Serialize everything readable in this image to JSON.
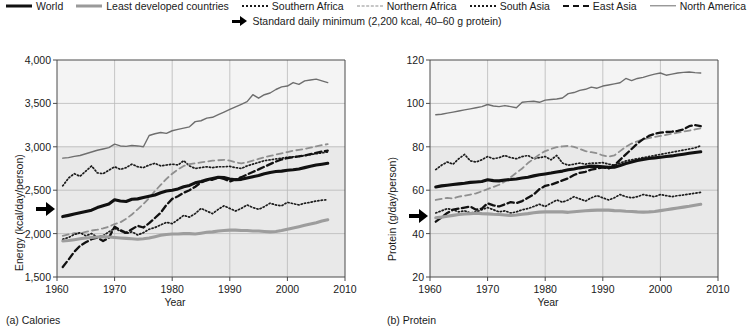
{
  "legend": {
    "items": [
      {
        "label": "World",
        "style": "solid-thick",
        "color": "#111111"
      },
      {
        "label": "Least developed countries",
        "style": "solid-grey",
        "color": "#9d9d9d"
      },
      {
        "label": "Southern Africa",
        "style": "dotted",
        "color": "#1c1c1c"
      },
      {
        "label": "Northern Africa",
        "style": "dashed-grey",
        "color": "#8f8f8f"
      },
      {
        "label": "South Asia",
        "style": "dotted",
        "color": "#1c1c1c"
      },
      {
        "label": "East Asia",
        "style": "dashed-dark",
        "color": "#111111"
      },
      {
        "label": "North America",
        "style": "solid-thin",
        "color": "#6e6e6e"
      }
    ],
    "annotation": {
      "icon": "right-arrow-icon",
      "label": "Standard daily minimum (2,200 kcal, 40–60 g protein)"
    }
  },
  "panels": {
    "left": {
      "caption": "(a) Calories",
      "xlabel": "Year",
      "ylabel": "Energy (kcal/day/person)",
      "ytick_labels": [
        "4,000",
        "3,500",
        "3,000",
        "2,500",
        "2,000",
        "1,500"
      ],
      "xtick_labels": [
        "1960",
        "1970",
        "1980",
        "1990",
        "2000",
        "2010"
      ],
      "reference_arrow_value": "2,200"
    },
    "right": {
      "caption": "(b) Protein",
      "xlabel": "Year",
      "ylabel": "Protein (g/day/person)",
      "ytick_labels": [
        "120",
        "100",
        "80",
        "60",
        "40",
        "20"
      ],
      "xtick_labels": [
        "1960",
        "1970",
        "1980",
        "1990",
        "2000",
        "2010"
      ],
      "reference_arrow_value": "48"
    }
  },
  "chart_data": [
    {
      "type": "line",
      "title": "(a) Calories",
      "xlabel": "Year",
      "ylabel": "Energy (kcal/day/person)",
      "xlim": [
        1960,
        2010
      ],
      "ylim": [
        1500,
        4000
      ],
      "yticks": [
        1500,
        2000,
        2500,
        3000,
        3500,
        4000
      ],
      "xticks": [
        1960,
        1970,
        1980,
        1990,
        2000,
        2010
      ],
      "grid": true,
      "legend_position": "top",
      "annotations": [
        {
          "text": "Standard daily minimum",
          "y": 2200,
          "marker": "arrow-left-axis"
        }
      ],
      "x": [
        1961,
        1962,
        1963,
        1964,
        1965,
        1966,
        1967,
        1968,
        1969,
        1970,
        1971,
        1972,
        1973,
        1974,
        1975,
        1976,
        1977,
        1978,
        1979,
        1980,
        1981,
        1982,
        1983,
        1984,
        1985,
        1986,
        1987,
        1988,
        1989,
        1990,
        1991,
        1992,
        1993,
        1994,
        1995,
        1996,
        1997,
        1998,
        1999,
        2000,
        2001,
        2002,
        2003,
        2004,
        2005,
        2006,
        2007
      ],
      "series": [
        {
          "name": "World",
          "style": "solid-thick",
          "color": "#111111",
          "values": [
            2196,
            2210,
            2225,
            2240,
            2255,
            2270,
            2300,
            2320,
            2340,
            2390,
            2375,
            2370,
            2395,
            2400,
            2415,
            2430,
            2445,
            2470,
            2490,
            2500,
            2515,
            2540,
            2555,
            2585,
            2600,
            2620,
            2635,
            2650,
            2645,
            2630,
            2620,
            2625,
            2640,
            2655,
            2670,
            2690,
            2705,
            2715,
            2720,
            2730,
            2735,
            2745,
            2760,
            2775,
            2790,
            2800,
            2810
          ]
        },
        {
          "name": "Least developed countries",
          "style": "solid-grey",
          "color": "#9d9d9d",
          "values": [
            1915,
            1920,
            1930,
            1940,
            1950,
            1955,
            1960,
            1965,
            1960,
            1955,
            1950,
            1945,
            1940,
            1935,
            1940,
            1950,
            1965,
            1980,
            1990,
            1995,
            1995,
            2000,
            2000,
            1995,
            2005,
            2015,
            2020,
            2030,
            2035,
            2040,
            2040,
            2035,
            2035,
            2030,
            2030,
            2025,
            2020,
            2025,
            2035,
            2050,
            2065,
            2080,
            2095,
            2110,
            2125,
            2145,
            2160
          ]
        },
        {
          "name": "Southern Africa",
          "style": "dotted",
          "color": "#1c1c1c",
          "values": [
            2550,
            2640,
            2690,
            2660,
            2720,
            2780,
            2700,
            2690,
            2730,
            2770,
            2740,
            2760,
            2800,
            2770,
            2760,
            2790,
            2810,
            2780,
            2790,
            2800,
            2790,
            2840,
            2780,
            2750,
            2760,
            2770,
            2760,
            2770,
            2770,
            2775,
            2760,
            2750,
            2780,
            2800,
            2820,
            2840,
            2850,
            2860,
            2870,
            2880,
            2885,
            2890,
            2900,
            2910,
            2920,
            2930,
            2940
          ]
        },
        {
          "name": "Northern Africa",
          "style": "dashed-grey",
          "color": "#8f8f8f",
          "values": [
            1975,
            1990,
            2005,
            2000,
            2020,
            2035,
            2045,
            2060,
            2080,
            2110,
            2130,
            2170,
            2220,
            2280,
            2340,
            2410,
            2490,
            2560,
            2630,
            2690,
            2740,
            2780,
            2800,
            2810,
            2820,
            2830,
            2840,
            2845,
            2850,
            2840,
            2820,
            2810,
            2820,
            2840,
            2860,
            2880,
            2895,
            2910,
            2925,
            2940,
            2955,
            2965,
            2975,
            2990,
            3005,
            3020,
            3030
          ]
        },
        {
          "name": "South Asia",
          "style": "dotted",
          "color": "#1c1c1c",
          "values": [
            1935,
            1955,
            1990,
            2010,
            1975,
            2000,
            1960,
            1975,
            2020,
            2060,
            2030,
            2000,
            2020,
            1985,
            2010,
            2050,
            2070,
            2100,
            2130,
            2115,
            2160,
            2210,
            2190,
            2230,
            2290,
            2260,
            2230,
            2280,
            2320,
            2290,
            2260,
            2290,
            2330,
            2300,
            2280,
            2310,
            2350,
            2330,
            2320,
            2360,
            2345,
            2330,
            2350,
            2360,
            2375,
            2385,
            2390
          ]
        },
        {
          "name": "East Asia",
          "style": "dashed-dark",
          "color": "#111111",
          "values": [
            1615,
            1700,
            1790,
            1860,
            1900,
            1935,
            1955,
            1915,
            1950,
            2080,
            2040,
            2010,
            2050,
            2090,
            2070,
            2120,
            2180,
            2240,
            2330,
            2400,
            2430,
            2470,
            2500,
            2540,
            2590,
            2615,
            2620,
            2645,
            2630,
            2600,
            2625,
            2650,
            2680,
            2710,
            2740,
            2770,
            2800,
            2830,
            2855,
            2870,
            2880,
            2890,
            2900,
            2915,
            2930,
            2945,
            2955
          ]
        },
        {
          "name": "North America",
          "style": "solid-thin",
          "color": "#6e6e6e",
          "values": [
            2870,
            2875,
            2890,
            2900,
            2920,
            2940,
            2960,
            2975,
            2990,
            3030,
            3010,
            3005,
            3015,
            3010,
            3000,
            3130,
            3150,
            3165,
            3155,
            3185,
            3200,
            3215,
            3230,
            3290,
            3300,
            3330,
            3340,
            3370,
            3400,
            3430,
            3460,
            3490,
            3520,
            3600,
            3560,
            3600,
            3620,
            3660,
            3690,
            3700,
            3740,
            3720,
            3760,
            3770,
            3780,
            3760,
            3740
          ]
        }
      ]
    },
    {
      "type": "line",
      "title": "(b) Protein",
      "xlabel": "Year",
      "ylabel": "Protein (g/day/person)",
      "xlim": [
        1960,
        2010
      ],
      "ylim": [
        20,
        120
      ],
      "yticks": [
        20,
        40,
        60,
        80,
        100,
        120
      ],
      "xticks": [
        1960,
        1970,
        1980,
        1990,
        2000,
        2010
      ],
      "grid": true,
      "legend_position": "top",
      "annotations": [
        {
          "text": "Standard daily minimum",
          "y": 48,
          "marker": "arrow-left-axis"
        }
      ],
      "x": [
        1961,
        1962,
        1963,
        1964,
        1965,
        1966,
        1967,
        1968,
        1969,
        1970,
        1971,
        1972,
        1973,
        1974,
        1975,
        1976,
        1977,
        1978,
        1979,
        1980,
        1981,
        1982,
        1983,
        1984,
        1985,
        1986,
        1987,
        1988,
        1989,
        1990,
        1991,
        1992,
        1993,
        1994,
        1995,
        1996,
        1997,
        1998,
        1999,
        2000,
        2001,
        2002,
        2003,
        2004,
        2005,
        2006,
        2007
      ],
      "series": [
        {
          "name": "World",
          "style": "solid-thick",
          "color": "#111111",
          "values": [
            61.5,
            62.0,
            62.3,
            62.6,
            62.9,
            63.2,
            63.6,
            63.8,
            64.0,
            64.8,
            64.4,
            64.3,
            64.7,
            64.9,
            65.2,
            65.6,
            66.0,
            66.6,
            67.1,
            67.5,
            67.9,
            68.4,
            68.8,
            69.4,
            69.8,
            70.3,
            70.7,
            71.1,
            71.0,
            70.8,
            70.5,
            70.6,
            71.4,
            72.3,
            73.0,
            73.7,
            74.2,
            74.6,
            74.9,
            75.2,
            75.5,
            75.8,
            76.2,
            76.6,
            77.0,
            77.4,
            77.7
          ]
        },
        {
          "name": "Least developed countries",
          "style": "solid-grey",
          "color": "#9d9d9d",
          "values": [
            47.3,
            47.6,
            48.0,
            48.4,
            48.8,
            49.0,
            49.2,
            49.4,
            49.2,
            49.1,
            48.9,
            48.8,
            48.6,
            48.4,
            48.6,
            48.9,
            49.2,
            49.6,
            49.9,
            50.0,
            50.0,
            50.1,
            50.0,
            49.8,
            50.1,
            50.3,
            50.5,
            50.7,
            50.8,
            50.9,
            50.8,
            50.6,
            50.5,
            50.3,
            50.2,
            50.0,
            49.9,
            50.0,
            50.2,
            50.6,
            51.0,
            51.4,
            51.8,
            52.2,
            52.6,
            53.1,
            53.5
          ]
        },
        {
          "name": "Southern Africa",
          "style": "dotted",
          "color": "#1c1c1c",
          "values": [
            69.5,
            71.5,
            73.0,
            72.0,
            74.5,
            76.5,
            73.5,
            73.0,
            74.0,
            75.5,
            74.5,
            75.0,
            76.0,
            75.0,
            74.5,
            75.5,
            76.0,
            74.5,
            75.0,
            75.5,
            74.0,
            76.0,
            72.5,
            71.5,
            72.0,
            72.5,
            72.0,
            72.5,
            72.5,
            72.7,
            72.0,
            71.5,
            72.5,
            73.5,
            74.0,
            74.5,
            75.0,
            75.5,
            76.0,
            76.5,
            77.0,
            77.5,
            78.0,
            78.5,
            79.0,
            79.5,
            80.5
          ]
        },
        {
          "name": "Northern Africa",
          "style": "dashed-grey",
          "color": "#8f8f8f",
          "values": [
            55.5,
            56.0,
            56.5,
            56.2,
            57.0,
            57.5,
            58.0,
            58.5,
            59.5,
            60.5,
            61.5,
            62.5,
            64.0,
            66.0,
            68.0,
            70.0,
            72.5,
            74.5,
            76.5,
            78.0,
            79.0,
            79.8,
            80.2,
            80.4,
            80.0,
            79.0,
            78.0,
            77.5,
            77.0,
            76.0,
            75.5,
            76.0,
            78.0,
            80.0,
            81.5,
            82.5,
            83.5,
            84.0,
            84.5,
            85.0,
            85.5,
            86.0,
            86.5,
            87.0,
            87.5,
            88.0,
            88.5
          ]
        },
        {
          "name": "South Asia",
          "style": "dotted",
          "color": "#1c1c1c",
          "values": [
            49.5,
            50.5,
            51.5,
            51.0,
            50.0,
            50.5,
            49.5,
            50.0,
            51.0,
            52.0,
            51.0,
            50.0,
            50.5,
            49.5,
            50.0,
            51.0,
            51.5,
            52.5,
            53.5,
            52.5,
            54.0,
            55.5,
            54.5,
            55.5,
            57.0,
            56.0,
            55.0,
            56.5,
            57.5,
            56.5,
            55.5,
            56.5,
            58.0,
            57.0,
            56.5,
            57.0,
            58.0,
            57.5,
            57.0,
            58.0,
            57.5,
            57.0,
            57.5,
            57.8,
            58.2,
            58.6,
            59.0
          ]
        },
        {
          "name": "East Asia",
          "style": "dashed-dark",
          "color": "#111111",
          "values": [
            45.5,
            47.5,
            49.5,
            51.0,
            51.5,
            52.0,
            52.5,
            51.0,
            51.5,
            54.0,
            53.0,
            52.5,
            53.5,
            54.5,
            54.0,
            55.0,
            56.5,
            58.0,
            60.5,
            62.0,
            62.5,
            63.5,
            64.5,
            65.5,
            67.0,
            68.0,
            68.5,
            69.5,
            70.0,
            70.5,
            70.0,
            71.5,
            74.0,
            76.5,
            79.0,
            81.5,
            83.5,
            85.0,
            86.0,
            86.5,
            86.8,
            87.0,
            87.3,
            88.0,
            89.5,
            90.0,
            89.5
          ]
        },
        {
          "name": "North America",
          "style": "solid-thin",
          "color": "#6e6e6e",
          "values": [
            94.8,
            95.0,
            95.5,
            96.0,
            96.5,
            97.0,
            97.5,
            98.0,
            98.5,
            99.5,
            98.8,
            98.5,
            99.0,
            98.5,
            98.0,
            100.5,
            100.8,
            101.0,
            100.5,
            101.5,
            101.8,
            102.0,
            102.5,
            104.5,
            105.0,
            106.0,
            106.5,
            107.5,
            107.0,
            108.0,
            108.5,
            109.0,
            109.5,
            111.5,
            110.5,
            111.5,
            112.0,
            112.8,
            113.5,
            114.0,
            113.0,
            113.5,
            114.0,
            114.3,
            114.5,
            114.2,
            114.0
          ]
        }
      ]
    }
  ]
}
